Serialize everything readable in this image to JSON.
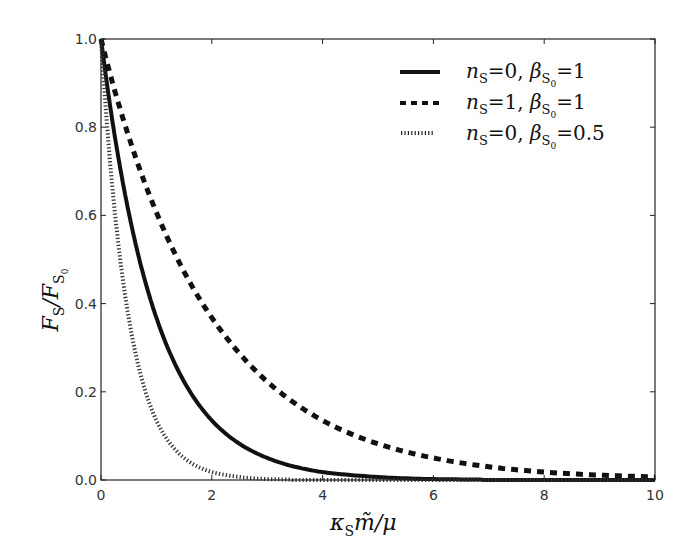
{
  "chart_data": {
    "type": "line",
    "title": "",
    "xlabel": "κ_S m̃ / μ",
    "ylabel": "F_S / F_S0",
    "xlim": [
      0,
      10
    ],
    "ylim": [
      0,
      1.0
    ],
    "xticks": [
      "0",
      "2",
      "4",
      "6",
      "8",
      "10"
    ],
    "yticks": [
      "0.0",
      "0.2",
      "0.4",
      "0.6",
      "0.8",
      "1.0"
    ],
    "grid": false,
    "legend_position": "upper right",
    "x": [
      0,
      0.25,
      0.5,
      0.75,
      1,
      1.5,
      2,
      2.5,
      3,
      3.5,
      4,
      5,
      6,
      7,
      8,
      9,
      10
    ],
    "series": [
      {
        "name": "n_S=0, β_S0=1",
        "style": "solid",
        "values": [
          1.0,
          0.779,
          0.607,
          0.472,
          0.368,
          0.223,
          0.135,
          0.082,
          0.05,
          0.03,
          0.018,
          0.007,
          0.002,
          0.001,
          0.0,
          0.0,
          0.0
        ]
      },
      {
        "name": "n_S=1, β_S0=1",
        "style": "dashed",
        "values": [
          1.0,
          0.882,
          0.779,
          0.687,
          0.607,
          0.472,
          0.368,
          0.287,
          0.223,
          0.174,
          0.135,
          0.082,
          0.05,
          0.03,
          0.018,
          0.011,
          0.007
        ]
      },
      {
        "name": "n_S=0, β_S0=0.5",
        "style": "dotted",
        "values": [
          1.0,
          0.607,
          0.368,
          0.223,
          0.135,
          0.05,
          0.018,
          0.007,
          0.002,
          0.001,
          0.0,
          0.0,
          0.0,
          0.0,
          0.0,
          0.0,
          0.0
        ]
      }
    ]
  },
  "axes": {
    "x_label": {
      "main": "κ",
      "sub": "S",
      "rest": "m̃/μ"
    },
    "y_label": {
      "main1": "F",
      "sub1": "S",
      "slash": "/",
      "main2": "F",
      "sub2": "S",
      "subsub2": "0"
    }
  },
  "legend": [
    {
      "n": "n",
      "n_sub": "S",
      "n_val": "=0, ",
      "b": "β",
      "b_sub": "S",
      "b_subsub": "0",
      "b_val": "=1"
    },
    {
      "n": "n",
      "n_sub": "S",
      "n_val": "=1, ",
      "b": "β",
      "b_sub": "S",
      "b_subsub": "0",
      "b_val": "=1"
    },
    {
      "n": "n",
      "n_sub": "S",
      "n_val": "=0, ",
      "b": "β",
      "b_sub": "S",
      "b_subsub": "0",
      "b_val": "=0.5"
    }
  ],
  "colors": {
    "line": "#111111",
    "axis": "#222222",
    "tick_text": "#333333"
  }
}
